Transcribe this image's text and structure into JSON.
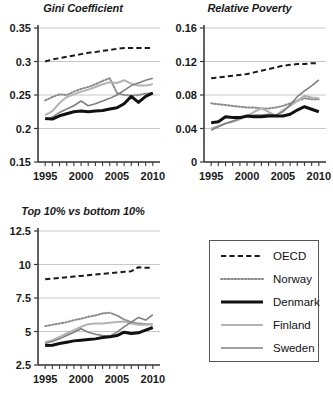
{
  "figure": {
    "background_color": "#ffffff",
    "panel_count": 3
  },
  "legend": {
    "position": "bottom-right",
    "border_color": "#555555",
    "entries": [
      {
        "label": "OECD",
        "style": "dashed",
        "color": "#1a1a1a",
        "width": 2.0
      },
      {
        "label": "Norway",
        "style": "dotted",
        "color": "#8c8c8c",
        "width": 2.0
      },
      {
        "label": "Denmark",
        "style": "solid",
        "color": "#111111",
        "width": 3.0
      },
      {
        "label": "Finland",
        "style": "solid",
        "color": "#b3b3b3",
        "width": 2.0
      },
      {
        "label": "Sweden",
        "style": "solid",
        "color": "#808080",
        "width": 1.6
      }
    ]
  },
  "chart_data": [
    {
      "type": "line",
      "title": "Gini Coefficient",
      "xlabel": "",
      "ylabel": "",
      "xlim": [
        1994,
        2011
      ],
      "ylim": [
        0.15,
        0.35
      ],
      "yticks": [
        0.15,
        0.2,
        0.25,
        0.3,
        0.35
      ],
      "ytick_labels": [
        "0.15",
        "0.2",
        "0.25",
        "0.3",
        "0.35"
      ],
      "xticks": [
        1995,
        2000,
        2005,
        2010
      ],
      "xtick_labels": [
        "1995",
        "2000",
        "2005",
        "2010"
      ],
      "minor_xticks_every": 1,
      "grid": "horizontal",
      "legend_position": "none",
      "x": [
        1995,
        1996,
        1997,
        1998,
        1999,
        2000,
        2001,
        2002,
        2003,
        2004,
        2005,
        2006,
        2007,
        2008,
        2009,
        2010
      ],
      "series": [
        {
          "name": "OECD",
          "values": [
            0.3,
            0.303,
            0.305,
            0.307,
            0.309,
            0.311,
            0.313,
            0.314,
            0.316,
            0.317,
            0.319,
            0.32,
            0.32,
            0.32,
            0.32,
            0.32
          ]
        },
        {
          "name": "Norway",
          "values": [
            0.242,
            0.247,
            0.251,
            0.25,
            0.255,
            0.259,
            0.262,
            0.266,
            0.271,
            0.275,
            0.253,
            0.25,
            0.249,
            0.25,
            0.252,
            0.253
          ]
        },
        {
          "name": "Denmark",
          "values": [
            0.215,
            0.214,
            0.219,
            0.222,
            0.225,
            0.226,
            0.225,
            0.226,
            0.227,
            0.229,
            0.231,
            0.237,
            0.248,
            0.239,
            0.248,
            0.253
          ]
        },
        {
          "name": "Finland",
          "values": [
            0.22,
            0.226,
            0.238,
            0.247,
            0.251,
            0.255,
            0.258,
            0.262,
            0.266,
            0.269,
            0.268,
            0.272,
            0.267,
            0.264,
            0.264,
            0.266
          ]
        },
        {
          "name": "Sweden",
          "values": [
            0.213,
            0.217,
            0.224,
            0.229,
            0.234,
            0.241,
            0.234,
            0.237,
            0.241,
            0.245,
            0.25,
            0.257,
            0.264,
            0.268,
            0.272,
            0.275
          ]
        }
      ]
    },
    {
      "type": "line",
      "title": "Relative Poverty",
      "xlabel": "",
      "ylabel": "",
      "xlim": [
        1994,
        2011
      ],
      "ylim": [
        0,
        0.16
      ],
      "yticks": [
        0,
        0.04,
        0.08,
        0.12,
        0.16
      ],
      "ytick_labels": [
        "0",
        "0.04",
        "0.08",
        "0.12",
        "0.16"
      ],
      "xticks": [
        1995,
        2000,
        2005,
        2010
      ],
      "xtick_labels": [
        "1995",
        "2000",
        "2005",
        "2010"
      ],
      "minor_xticks_every": 1,
      "grid": "horizontal",
      "legend_position": "none",
      "x": [
        1995,
        1996,
        1997,
        1998,
        1999,
        2000,
        2001,
        2002,
        2003,
        2004,
        2005,
        2006,
        2007,
        2008,
        2009,
        2010
      ],
      "series": [
        {
          "name": "OECD",
          "values": [
            0.1,
            0.101,
            0.102,
            0.103,
            0.104,
            0.105,
            0.107,
            0.109,
            0.111,
            0.113,
            0.115,
            0.116,
            0.117,
            0.117,
            0.118,
            0.118
          ]
        },
        {
          "name": "Norway",
          "values": [
            0.07,
            0.069,
            0.068,
            0.067,
            0.066,
            0.065,
            0.065,
            0.064,
            0.064,
            0.065,
            0.067,
            0.07,
            0.073,
            0.076,
            0.075,
            0.075
          ]
        },
        {
          "name": "Denmark",
          "values": [
            0.047,
            0.048,
            0.054,
            0.053,
            0.053,
            0.055,
            0.054,
            0.054,
            0.055,
            0.055,
            0.055,
            0.057,
            0.062,
            0.066,
            0.063,
            0.06
          ]
        },
        {
          "name": "Finland",
          "values": [
            0.04,
            0.043,
            0.046,
            0.048,
            0.051,
            0.055,
            0.06,
            0.064,
            0.06,
            0.055,
            0.062,
            0.067,
            0.073,
            0.079,
            0.077,
            0.076
          ]
        },
        {
          "name": "Sweden",
          "values": [
            0.038,
            0.042,
            0.046,
            0.049,
            0.052,
            0.055,
            0.056,
            0.056,
            0.057,
            0.056,
            0.06,
            0.068,
            0.078,
            0.085,
            0.091,
            0.098
          ]
        }
      ]
    },
    {
      "type": "line",
      "title": "Top 10% vs bottom 10%",
      "xlabel": "",
      "ylabel": "",
      "xlim": [
        1994,
        2011
      ],
      "ylim": [
        2.5,
        12.5
      ],
      "yticks": [
        2.5,
        5,
        7.5,
        10,
        12.5
      ],
      "ytick_labels": [
        "2.5",
        "5",
        "7.5",
        "10",
        "12.5"
      ],
      "xticks": [
        1995,
        2000,
        2005,
        2010
      ],
      "xtick_labels": [
        "1995",
        "2000",
        "2005",
        "2010"
      ],
      "minor_xticks_every": 1,
      "grid": "horizontal",
      "legend_position": "none",
      "x": [
        1995,
        1996,
        1997,
        1998,
        1999,
        2000,
        2001,
        2002,
        2003,
        2004,
        2005,
        2006,
        2007,
        2008,
        2009,
        2010
      ],
      "series": [
        {
          "name": "OECD",
          "values": [
            8.9,
            8.95,
            9.0,
            9.05,
            9.1,
            9.15,
            9.2,
            9.25,
            9.3,
            9.35,
            9.4,
            9.45,
            9.5,
            9.8,
            9.75,
            9.75
          ]
        },
        {
          "name": "Norway",
          "values": [
            5.4,
            5.5,
            5.6,
            5.7,
            5.85,
            5.95,
            6.1,
            6.2,
            6.35,
            6.4,
            6.2,
            5.9,
            5.7,
            5.6,
            5.55,
            5.55
          ]
        },
        {
          "name": "Denmark",
          "values": [
            3.95,
            3.98,
            4.1,
            4.2,
            4.3,
            4.35,
            4.4,
            4.45,
            4.55,
            4.6,
            4.7,
            4.95,
            4.85,
            4.9,
            5.1,
            5.3
          ]
        },
        {
          "name": "Finland",
          "values": [
            4.2,
            4.35,
            4.6,
            4.85,
            5.1,
            5.35,
            5.55,
            5.6,
            5.6,
            5.65,
            5.7,
            5.75,
            5.6,
            5.5,
            5.5,
            5.55
          ]
        },
        {
          "name": "Sweden",
          "values": [
            4.1,
            4.25,
            4.45,
            4.7,
            4.95,
            5.2,
            4.95,
            4.8,
            4.7,
            4.65,
            4.95,
            5.35,
            5.7,
            6.05,
            5.85,
            6.25
          ]
        }
      ]
    }
  ]
}
